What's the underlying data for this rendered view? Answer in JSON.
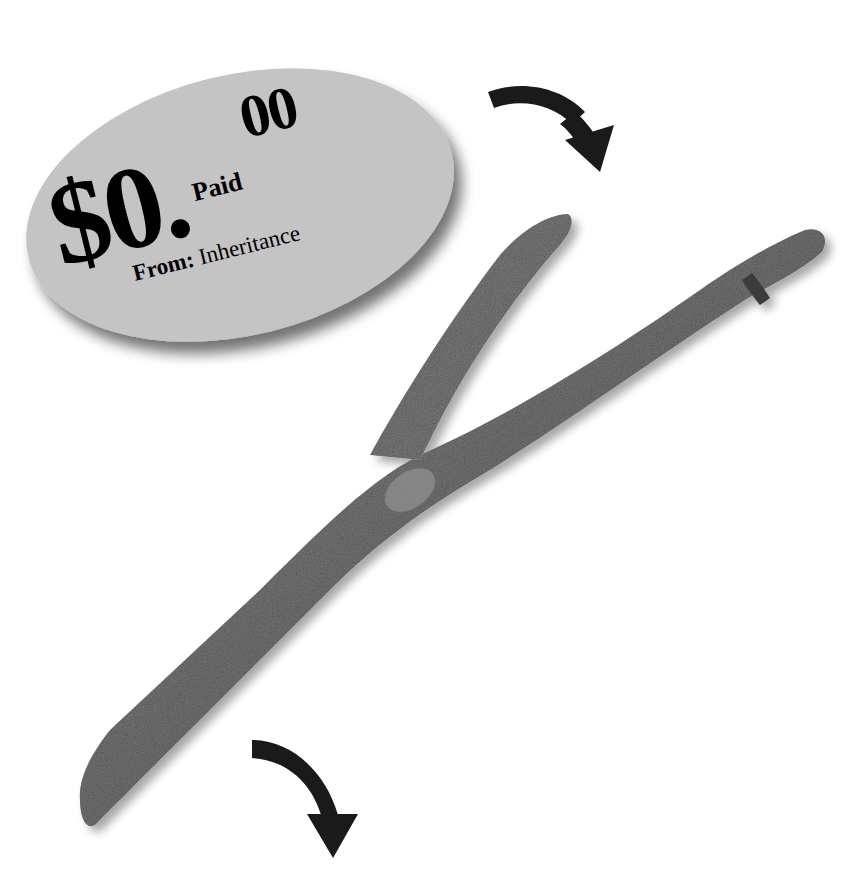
{
  "tag": {
    "amount_main": "$0.",
    "amount_cents": "00",
    "status": "Paid",
    "from_label": "From:",
    "from_value": "Inheritance"
  },
  "icons": {
    "top_arrow": "curved-arrow-down-right",
    "bottom_arrow": "curved-arrow-down"
  },
  "colors": {
    "background": "#ffffff",
    "tag_fill": "#c4c4c4",
    "text": "#0d0d0d",
    "stick": "#6e6e6e",
    "arrow": "#1a1a1a"
  }
}
